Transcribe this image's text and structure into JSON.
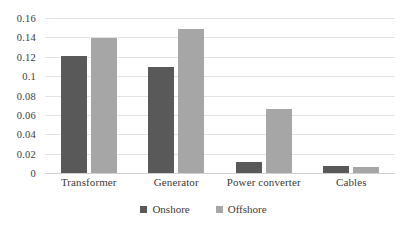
{
  "chart_data": {
    "type": "bar",
    "title": "",
    "subtitle": "",
    "xlabel": "",
    "ylabel": "",
    "categories": [
      "Transformer",
      "Generator",
      "Power converter",
      "Cables"
    ],
    "series": [
      {
        "name": "Onshore",
        "color": "#595959",
        "values": [
          0.121,
          0.109,
          0.0115,
          0.007
        ]
      },
      {
        "name": "Offshore",
        "color": "#a6a6a6",
        "values": [
          0.139,
          0.1485,
          0.066,
          0.006
        ]
      }
    ],
    "ylim": [
      0,
      0.16
    ],
    "ytick_step": 0.02,
    "yticks": [
      "0.16",
      "0.14",
      "0.12",
      "0.1",
      "0.08",
      "0.06",
      "0.04",
      "0.02",
      "0"
    ],
    "ytick_values": [
      0.16,
      0.14,
      0.12,
      0.1,
      0.08,
      0.06,
      0.04,
      0.02,
      0
    ],
    "grid": true,
    "grid_color": "#e3e3e3",
    "legend_position": "bottom-center",
    "background": "#ffffff"
  },
  "legend": {
    "entries": [
      {
        "label": "Onshore"
      },
      {
        "label": "Offshore"
      }
    ]
  }
}
